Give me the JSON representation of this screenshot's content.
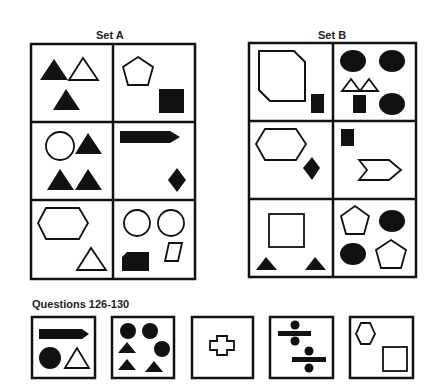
{
  "set_a": {
    "title": "Set A"
  },
  "set_b": {
    "title": "Set B"
  },
  "questions": {
    "title": "Questions 126-130"
  },
  "colors": {
    "stroke": "#111111",
    "fill": "#111111",
    "background": "#ffffff"
  },
  "set_a_cells": [
    {
      "row": 1,
      "col": 1,
      "shapes": [
        "filled-triangle",
        "outline-triangle",
        "filled-triangle"
      ]
    },
    {
      "row": 1,
      "col": 2,
      "shapes": [
        "outline-pentagon",
        "filled-square"
      ]
    },
    {
      "row": 2,
      "col": 1,
      "shapes": [
        "outline-circle",
        "filled-triangle",
        "filled-triangle",
        "filled-triangle"
      ]
    },
    {
      "row": 2,
      "col": 2,
      "shapes": [
        "filled-arrow-bar",
        "filled-diamond"
      ]
    },
    {
      "row": 3,
      "col": 1,
      "shapes": [
        "outline-hexagon",
        "outline-triangle"
      ]
    },
    {
      "row": 3,
      "col": 2,
      "shapes": [
        "outline-circle",
        "outline-circle",
        "filled-cut-rectangle",
        "outline-parallelogram"
      ]
    }
  ],
  "set_b_cells": [
    {
      "row": 1,
      "col": 1,
      "shapes": [
        "outline-cut-square",
        "filled-rectangle"
      ]
    },
    {
      "row": 1,
      "col": 2,
      "shapes": [
        "filled-ellipse",
        "filled-ellipse",
        "outline-triangle",
        "outline-triangle",
        "filled-rectangle",
        "filled-ellipse"
      ]
    },
    {
      "row": 2,
      "col": 1,
      "shapes": [
        "outline-hexagon",
        "filled-diamond"
      ]
    },
    {
      "row": 2,
      "col": 2,
      "shapes": [
        "filled-rectangle",
        "outline-chevron"
      ]
    },
    {
      "row": 3,
      "col": 1,
      "shapes": [
        "outline-square",
        "filled-triangle",
        "filled-triangle"
      ]
    },
    {
      "row": 3,
      "col": 2,
      "shapes": [
        "outline-pentagon",
        "filled-ellipse",
        "filled-ellipse",
        "outline-pentagon"
      ]
    }
  ],
  "question_boxes": [
    {
      "number": 126,
      "shapes": [
        "filled-arrow-bar",
        "filled-circle",
        "outline-triangle"
      ]
    },
    {
      "number": 127,
      "shapes": [
        "filled-circle",
        "filled-circle",
        "filled-triangle",
        "filled-circle",
        "filled-triangle",
        "filled-triangle"
      ]
    },
    {
      "number": 128,
      "shapes": [
        "outline-cross"
      ]
    },
    {
      "number": 129,
      "shapes": [
        "divide-sign",
        "divide-sign"
      ]
    },
    {
      "number": 130,
      "shapes": [
        "outline-hexagon",
        "outline-square"
      ]
    }
  ]
}
